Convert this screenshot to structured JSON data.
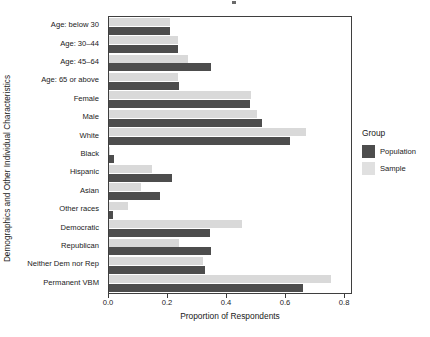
{
  "chart_data": {
    "type": "bar",
    "orientation": "horizontal",
    "title": "",
    "xlabel": "Proportion of Respondents",
    "ylabel": "Demographics and Other Individual Characteristics",
    "xlim": [
      0.0,
      0.82
    ],
    "xticks": [
      0.0,
      0.2,
      0.4,
      0.6,
      0.8
    ],
    "xticklabels": [
      "0.0",
      "0.2",
      "0.4",
      "0.6",
      "0.8"
    ],
    "grid": false,
    "legend": {
      "title": "Group",
      "position": "right",
      "entries": [
        {
          "name": "Population",
          "color": "#4d4d4d"
        },
        {
          "name": "Sample",
          "color": "#e0e0e0"
        }
      ]
    },
    "categories": [
      "Age: below 30",
      "Age: 30–44",
      "Age: 45–64",
      "Age: 65 or above",
      "Female",
      "Male",
      "White",
      "Black",
      "Hispanic",
      "Asian",
      "Other races",
      "Democratic",
      "Republican",
      "Neither Dem nor Rep",
      "Permanent VBM"
    ],
    "series": [
      {
        "name": "Population",
        "color": "#4d4d4d",
        "values": [
          0.208,
          0.233,
          0.345,
          0.236,
          0.477,
          0.517,
          0.614,
          0.017,
          0.213,
          0.174,
          0.013,
          0.342,
          0.346,
          0.325,
          0.657
        ]
      },
      {
        "name": "Sample",
        "color": "#d9d9d9",
        "values": [
          0.205,
          0.233,
          0.268,
          0.233,
          0.481,
          0.5,
          0.668,
          0.005,
          0.146,
          0.107,
          0.065,
          0.449,
          0.238,
          0.32,
          0.752
        ]
      }
    ]
  }
}
